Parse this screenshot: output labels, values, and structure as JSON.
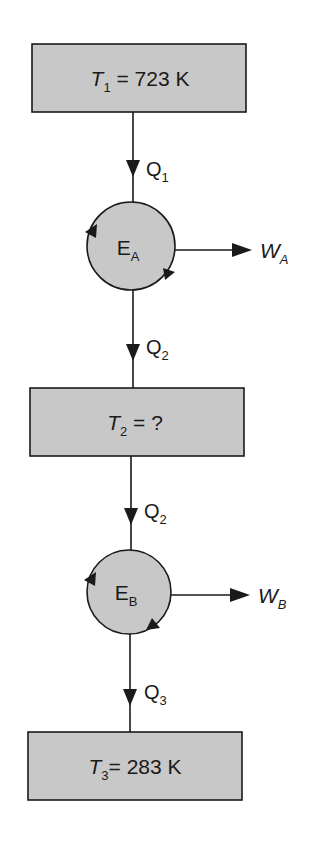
{
  "diagram": {
    "colors": {
      "fill": "#c8c8c8",
      "stroke": "#1a1a1a",
      "background": "#ffffff"
    },
    "reservoirs": [
      {
        "id": "T1",
        "symbol": "T",
        "sub": "1",
        "value": " = 723 K"
      },
      {
        "id": "T2",
        "symbol": "T",
        "sub": "2",
        "value": " = ?"
      },
      {
        "id": "T3",
        "symbol": "T",
        "sub": "3",
        "value": "= 283 K"
      }
    ],
    "engines": [
      {
        "id": "EA",
        "symbol": "E",
        "sub": "A",
        "work_symbol": "W",
        "work_sub": "A"
      },
      {
        "id": "EB",
        "symbol": "E",
        "sub": "B",
        "work_symbol": "W",
        "work_sub": "B"
      }
    ],
    "heat_flows": [
      {
        "symbol": "Q",
        "sub": "1"
      },
      {
        "symbol": "Q",
        "sub": "2"
      },
      {
        "symbol": "Q",
        "sub": "2"
      },
      {
        "symbol": "Q",
        "sub": "3"
      }
    ]
  }
}
